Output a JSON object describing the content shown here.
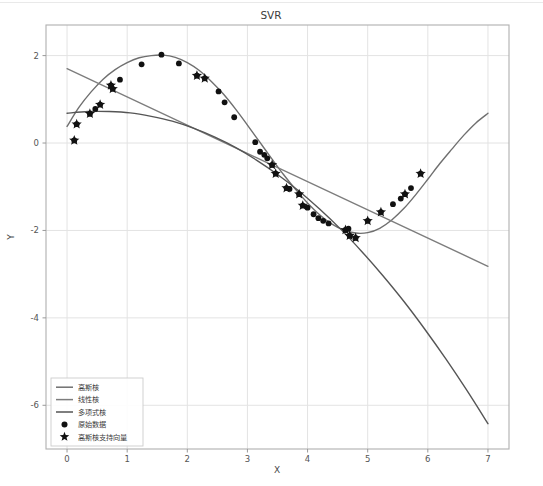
{
  "figure": {
    "title": "SVR",
    "background_color": "#ffffff",
    "axes_border_color": "#b0b0b0",
    "grid_color": "#e3e3e3",
    "width": 543,
    "height": 486
  },
  "axes": {
    "xlabel": "X",
    "ylabel": "Y",
    "xticks": [
      "0",
      "1",
      "2",
      "3",
      "4",
      "5",
      "6",
      "7"
    ],
    "yticks": [
      "2",
      "0",
      "-2",
      "-4",
      "-6"
    ],
    "xlim": [
      -0.35,
      7.35
    ],
    "ylim": [
      -7.0,
      2.7
    ]
  },
  "legend": {
    "items": [
      {
        "label": "高斯核",
        "marker": "line",
        "color": "#6f6f6f"
      },
      {
        "label": "线性核",
        "marker": "line",
        "color": "#7d7d7d"
      },
      {
        "label": "多项式核",
        "marker": "line",
        "color": "#555555"
      },
      {
        "label": "原始数据",
        "marker": "circle",
        "color": "#111111"
      },
      {
        "label": "高斯核支持向量",
        "marker": "star",
        "color": "#111111"
      }
    ],
    "border_color": "#cccccc"
  },
  "chart_data": {
    "type": "line",
    "title": "SVR",
    "xlabel": "X",
    "ylabel": "Y",
    "xlim": [
      -0.35,
      7.35
    ],
    "ylim": [
      -7.0,
      2.7
    ],
    "grid": true,
    "legend_position": "lower left",
    "series": [
      {
        "name": "高斯核",
        "type": "line",
        "color": "#6f6f6f",
        "x": [
          0.0,
          0.2,
          0.4,
          0.6,
          0.8,
          1.0,
          1.2,
          1.4,
          1.6,
          1.8,
          2.0,
          2.2,
          2.4,
          2.6,
          2.8,
          3.0,
          3.2,
          3.4,
          3.6,
          3.8,
          4.0,
          4.2,
          4.4,
          4.6,
          4.8,
          5.0,
          5.2,
          5.4,
          5.6,
          5.8,
          6.0,
          6.2,
          6.4,
          6.6,
          6.8,
          7.0
        ],
        "y": [
          0.38,
          0.82,
          1.17,
          1.46,
          1.68,
          1.84,
          1.95,
          2.0,
          2.01,
          1.96,
          1.84,
          1.66,
          1.41,
          1.12,
          0.78,
          0.41,
          0.03,
          -0.35,
          -0.72,
          -1.06,
          -1.37,
          -1.64,
          -1.85,
          -1.99,
          -2.06,
          -2.05,
          -1.95,
          -1.76,
          -1.5,
          -1.18,
          -0.83,
          -0.47,
          -0.14,
          0.18,
          0.46,
          0.68
        ]
      },
      {
        "name": "线性核",
        "type": "line",
        "color": "#7d7d7d",
        "x": [
          0.0,
          7.0
        ],
        "y": [
          1.7,
          -2.82
        ]
      },
      {
        "name": "多项式核",
        "type": "line",
        "color": "#555555",
        "x": [
          0.0,
          0.35,
          0.7,
          1.05,
          1.4,
          1.75,
          2.1,
          2.45,
          2.8,
          3.15,
          3.5,
          3.85,
          4.2,
          4.55,
          4.9,
          5.25,
          5.6,
          5.95,
          6.3,
          6.65,
          7.0
        ],
        "y": [
          0.68,
          0.72,
          0.72,
          0.69,
          0.61,
          0.5,
          0.34,
          0.14,
          -0.1,
          -0.39,
          -0.72,
          -1.09,
          -1.51,
          -1.97,
          -2.48,
          -3.03,
          -3.62,
          -4.26,
          -4.94,
          -5.66,
          -6.42
        ]
      },
      {
        "name": "原始数据",
        "type": "scatter",
        "marker": "circle",
        "color": "#111111",
        "points": [
          [
            0.12,
            0.06
          ],
          [
            0.16,
            0.43
          ],
          [
            0.38,
            0.67
          ],
          [
            0.47,
            0.78
          ],
          [
            0.55,
            0.88
          ],
          [
            0.73,
            1.32
          ],
          [
            0.76,
            1.24
          ],
          [
            0.88,
            1.45
          ],
          [
            1.24,
            1.8
          ],
          [
            1.57,
            2.02
          ],
          [
            1.86,
            1.82
          ],
          [
            2.16,
            1.54
          ],
          [
            2.29,
            1.48
          ],
          [
            2.52,
            1.18
          ],
          [
            2.62,
            0.93
          ],
          [
            2.78,
            0.59
          ],
          [
            3.13,
            0.02
          ],
          [
            3.21,
            -0.2
          ],
          [
            3.28,
            -0.27
          ],
          [
            3.33,
            -0.35
          ],
          [
            3.41,
            -0.5
          ],
          [
            3.47,
            -0.7
          ],
          [
            3.65,
            -1.03
          ],
          [
            3.7,
            -1.05
          ],
          [
            3.86,
            -1.17
          ],
          [
            3.92,
            -1.43
          ],
          [
            4.0,
            -1.48
          ],
          [
            4.1,
            -1.63
          ],
          [
            4.18,
            -1.72
          ],
          [
            4.26,
            -1.78
          ],
          [
            4.35,
            -1.84
          ],
          [
            4.63,
            -1.99
          ],
          [
            4.68,
            -1.96
          ],
          [
            4.7,
            -2.12
          ],
          [
            4.8,
            -2.17
          ],
          [
            5.0,
            -1.78
          ],
          [
            5.22,
            -1.58
          ],
          [
            5.42,
            -1.4
          ],
          [
            5.55,
            -1.27
          ],
          [
            5.62,
            -1.17
          ],
          [
            5.72,
            -1.03
          ],
          [
            5.88,
            -0.7
          ]
        ]
      },
      {
        "name": "高斯核支持向量",
        "type": "scatter",
        "marker": "star",
        "color": "#111111",
        "points": [
          [
            0.12,
            0.06
          ],
          [
            0.16,
            0.43
          ],
          [
            0.38,
            0.67
          ],
          [
            0.55,
            0.88
          ],
          [
            0.73,
            1.32
          ],
          [
            0.76,
            1.24
          ],
          [
            2.29,
            1.48
          ],
          [
            2.16,
            1.54
          ],
          [
            3.41,
            -0.5
          ],
          [
            3.47,
            -0.7
          ],
          [
            3.65,
            -1.03
          ],
          [
            3.86,
            -1.17
          ],
          [
            3.92,
            -1.43
          ],
          [
            4.7,
            -2.12
          ],
          [
            4.8,
            -2.17
          ],
          [
            4.63,
            -1.99
          ],
          [
            5.0,
            -1.78
          ],
          [
            5.22,
            -1.58
          ],
          [
            5.62,
            -1.17
          ],
          [
            5.88,
            -0.7
          ]
        ]
      }
    ]
  }
}
